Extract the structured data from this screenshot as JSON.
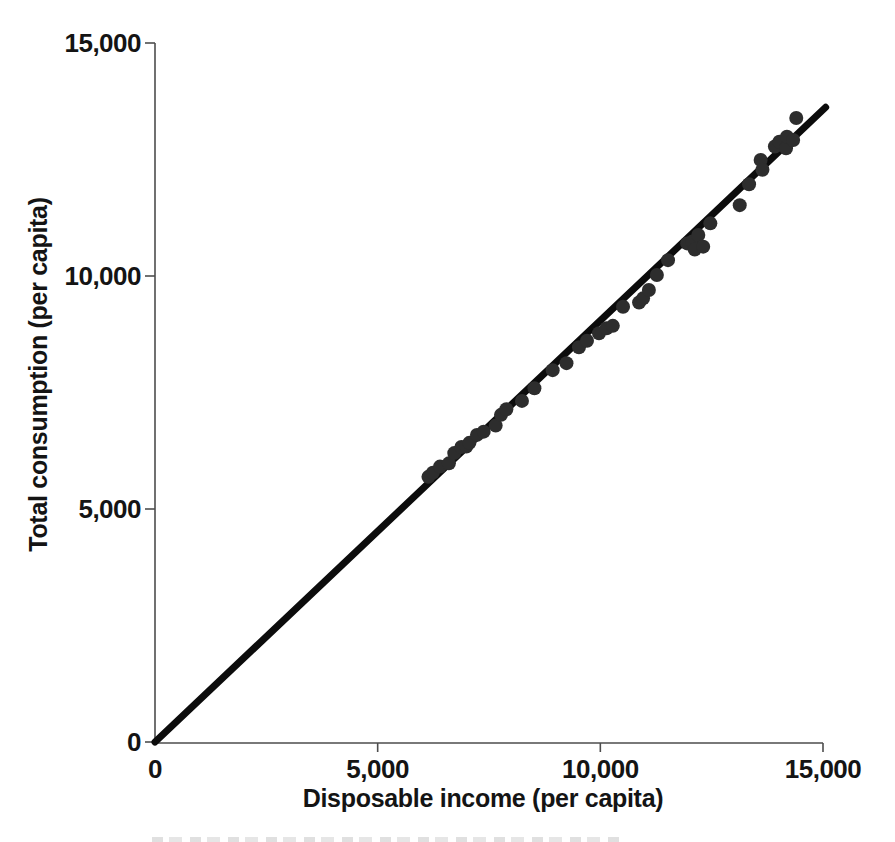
{
  "chart_data": {
    "type": "scatter",
    "title": "",
    "xlabel": "Disposable income (per capita)",
    "ylabel": "Total consumption (per capita)",
    "xlim": [
      0,
      15000
    ],
    "ylim": [
      0,
      15000
    ],
    "x_ticks": [
      0,
      5000,
      10000,
      15000
    ],
    "x_tick_labels": [
      "0",
      "5,000",
      "10,000",
      "15,000"
    ],
    "y_ticks": [
      0,
      5000,
      10000,
      15000
    ],
    "y_tick_labels": [
      "0",
      "5,000",
      "10,000",
      "15,000"
    ],
    "grid": false,
    "legend": "none",
    "trend_line": {
      "x1": 0,
      "y1": 0,
      "x2": 15060,
      "y2": 13620
    },
    "points": [
      [
        6140,
        5690
      ],
      [
        6240,
        5780
      ],
      [
        6400,
        5910
      ],
      [
        6600,
        5980
      ],
      [
        6720,
        6200
      ],
      [
        6880,
        6330
      ],
      [
        6990,
        6340
      ],
      [
        7060,
        6420
      ],
      [
        7230,
        6590
      ],
      [
        7380,
        6660
      ],
      [
        7650,
        6790
      ],
      [
        7770,
        7020
      ],
      [
        7890,
        7140
      ],
      [
        8240,
        7320
      ],
      [
        8520,
        7590
      ],
      [
        8930,
        7980
      ],
      [
        9240,
        8130
      ],
      [
        9520,
        8470
      ],
      [
        9700,
        8610
      ],
      [
        9970,
        8770
      ],
      [
        10140,
        8880
      ],
      [
        10280,
        8930
      ],
      [
        10510,
        9340
      ],
      [
        10870,
        9430
      ],
      [
        10960,
        9520
      ],
      [
        11090,
        9700
      ],
      [
        11270,
        10020
      ],
      [
        11520,
        10340
      ],
      [
        11950,
        10700
      ],
      [
        12070,
        10740
      ],
      [
        12120,
        10570
      ],
      [
        12200,
        10880
      ],
      [
        12310,
        10630
      ],
      [
        12470,
        11130
      ],
      [
        13130,
        11520
      ],
      [
        13340,
        11970
      ],
      [
        13600,
        12490
      ],
      [
        13640,
        12280
      ],
      [
        13920,
        12780
      ],
      [
        14020,
        12880
      ],
      [
        14170,
        12740
      ],
      [
        14190,
        12990
      ],
      [
        14330,
        12920
      ],
      [
        14400,
        13390
      ]
    ],
    "colors": {
      "point": "#2d2d2d",
      "trend_line": "#0c0c0c",
      "axis": "#4d4d4d",
      "text": "#141414",
      "background": "#ffffff"
    }
  }
}
